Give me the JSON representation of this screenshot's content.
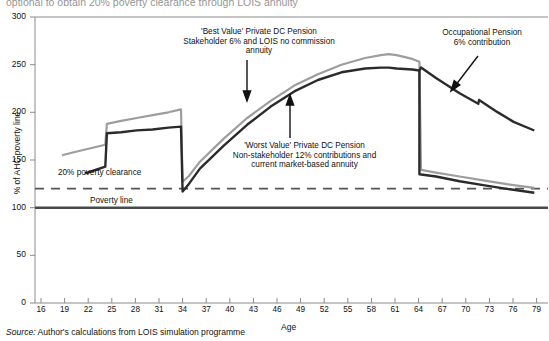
{
  "page": {
    "clipped_heading": "optional to obtain 20% poverty clearance through LOIS annuity",
    "source_prefix": "Source:",
    "source_text": " Author's calculations from LOIS simulation programme"
  },
  "axes": {
    "ylabel": "% of AHC poverty line",
    "xlabel": "Age",
    "yticks": [
      "0",
      "50",
      "100",
      "150",
      "200",
      "250",
      "300"
    ],
    "ytick_values": [
      0,
      50,
      100,
      150,
      200,
      250,
      300
    ],
    "xticks": [
      "16",
      "19",
      "22",
      "25",
      "28",
      "31",
      "34",
      "37",
      "40",
      "43",
      "46",
      "49",
      "52",
      "55",
      "58",
      "61",
      "64",
      "67",
      "70",
      "73",
      "76",
      "79"
    ],
    "xtick_values": [
      16,
      19,
      22,
      25,
      28,
      31,
      34,
      37,
      40,
      43,
      46,
      49,
      52,
      55,
      58,
      61,
      64,
      67,
      70,
      73,
      76,
      79
    ]
  },
  "annotations": {
    "best_value": "'Best Value' Private DC Pension\nStakeholder 6% and LOIS no commission\nannuity",
    "worst_value": "'Worst Value' Private DC Pension\nNon-stakeholder 12% contributions and\ncurrent market-based annuity",
    "occupational": "Occupational Pension\n6% contribution",
    "clearance": "20% poverty clearance",
    "poverty_line": "Poverty line"
  },
  "colors": {
    "best_value_line": "#9a9a9a",
    "worst_value_line": "#3a3a3a",
    "occupational_line": "#2b2b2b",
    "poverty_line": "#555555",
    "clearance_line": "#555555",
    "axis": "#7a7a7a",
    "background": "#ffffff"
  },
  "chart_data": {
    "type": "line",
    "title": "",
    "xlabel": "Age",
    "ylabel": "% of AHC poverty line",
    "xlim": [
      16,
      80
    ],
    "ylim": [
      0,
      300
    ],
    "grid": false,
    "legend": "annotations-with-arrows",
    "reference_lines": [
      {
        "name": "Poverty line",
        "y": 100,
        "style": "solid-thick"
      },
      {
        "name": "20% poverty clearance",
        "y": 120,
        "style": "dashed"
      }
    ],
    "series": [
      {
        "name": "'Best Value' Private DC Pension - Stakeholder 6% and LOIS no commission annuity",
        "color": "#9a9a9a",
        "x": [
          19.5,
          21,
          23,
          25,
          25.2,
          27,
          29,
          31,
          33,
          34.6,
          34.8,
          35.6,
          37,
          40,
          43,
          46,
          49,
          52,
          55,
          58,
          60,
          61,
          62,
          64,
          64.9,
          65.1,
          67,
          70,
          73,
          76,
          79.5
        ],
        "y": [
          155,
          158,
          162,
          166,
          188,
          191,
          194,
          197,
          200,
          203,
          127,
          133,
          148,
          172,
          194,
          212,
          228,
          240,
          250,
          257,
          260,
          261,
          260,
          256,
          253,
          139,
          136,
          132,
          128,
          124,
          120
        ]
      },
      {
        "name": "'Worst Value' Private DC Pension - Non-stakeholder 12% contributions and current market-based annuity / Occupational Pension 6% contribution",
        "color": "#2b2b2b",
        "x": [
          22.5,
          24,
          25,
          25.2,
          27,
          29,
          31,
          33,
          34.6,
          34.8,
          35.6,
          37,
          40,
          43,
          46,
          49,
          52,
          55,
          58,
          60,
          61,
          62,
          64,
          64.9,
          65.1,
          67,
          70,
          72.5,
          72.6,
          75,
          77,
          79.5
        ],
        "y": [
          136,
          140,
          143,
          178,
          179,
          181,
          182,
          184,
          185,
          117,
          125,
          141,
          165,
          187,
          206,
          222,
          234,
          242,
          246,
          247,
          247,
          246,
          245,
          244,
          247,
          236,
          220,
          209,
          213,
          200,
          190,
          181
        ]
      }
    ]
  }
}
